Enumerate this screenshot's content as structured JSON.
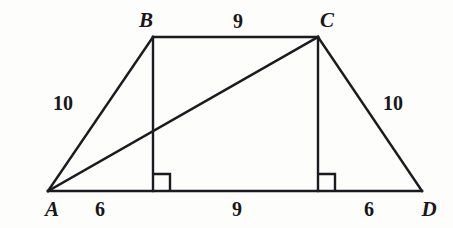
{
  "figure": {
    "stroke_color": "#1b1b1f",
    "background_color": "#fdfdfc",
    "stroke_width": 2.4,
    "vertices": [
      {
        "name": "A",
        "label": "A",
        "x": 48,
        "y": 191,
        "label_x": 52,
        "label_y": 209
      },
      {
        "name": "B",
        "label": "B",
        "x": 153,
        "y": 37,
        "label_x": 146,
        "label_y": 20
      },
      {
        "name": "C",
        "label": "C",
        "x": 318,
        "y": 37,
        "label_x": 327,
        "label_y": 20
      },
      {
        "name": "D",
        "label": "D",
        "x": 422,
        "y": 191,
        "label_x": 429,
        "label_y": 209
      }
    ],
    "segments": [
      {
        "name": "side-ab",
        "from": "A",
        "to": "B",
        "x1": 48,
        "y1": 191,
        "x2": 153,
        "y2": 37
      },
      {
        "name": "side-bc",
        "from": "B",
        "to": "C",
        "x1": 153,
        "y1": 37,
        "x2": 318,
        "y2": 37
      },
      {
        "name": "side-cd",
        "from": "C",
        "to": "D",
        "x1": 318,
        "y1": 37,
        "x2": 422,
        "y2": 191
      },
      {
        "name": "base-ad",
        "from": "A",
        "to": "D",
        "x1": 48,
        "y1": 191,
        "x2": 422,
        "y2": 191
      },
      {
        "name": "diagonal-ac",
        "from": "A",
        "to": "C",
        "x1": 48,
        "y1": 191,
        "x2": 318,
        "y2": 37
      },
      {
        "name": "altitude-from-b",
        "from": "B",
        "to": "foot-b",
        "x1": 153,
        "y1": 37,
        "x2": 153,
        "y2": 191
      },
      {
        "name": "altitude-from-c",
        "from": "C",
        "to": "foot-c",
        "x1": 318,
        "y1": 37,
        "x2": 318,
        "y2": 191
      }
    ],
    "right_angle_marks": [
      {
        "name": "right-angle-foot-b",
        "x": 153,
        "y": 191,
        "size": 17,
        "dir_x": 1
      },
      {
        "name": "right-angle-foot-c",
        "x": 318,
        "y": 191,
        "size": 17,
        "dir_x": 1
      }
    ],
    "measure_labels": [
      {
        "name": "length-ab",
        "text": "10",
        "x": 63,
        "y": 103,
        "for_segment": "side-ab"
      },
      {
        "name": "length-bc",
        "text": "9",
        "x": 238,
        "y": 21,
        "for_segment": "side-bc"
      },
      {
        "name": "length-cd",
        "text": "10",
        "x": 393,
        "y": 103,
        "for_segment": "side-cd"
      },
      {
        "name": "length-a-to-foot-b",
        "text": "6",
        "x": 100,
        "y": 209,
        "for_segment": "base-ad"
      },
      {
        "name": "length-foot-b-to-foot-c",
        "text": "9",
        "x": 237,
        "y": 209,
        "for_segment": "base-ad"
      },
      {
        "name": "length-foot-c-to-d",
        "text": "6",
        "x": 369,
        "y": 209,
        "for_segment": "base-ad"
      }
    ]
  },
  "chart_data": {
    "type": "diagram",
    "shape": "isosceles trapezoid",
    "labeled_lengths": {
      "AB": 10,
      "BC": 9,
      "CD": 10,
      "A_to_foot_of_B": 6,
      "foot_of_B_to_foot_of_C": 9,
      "foot_of_C_to_D": 6,
      "AD": 21
    },
    "right_angles_at": [
      "foot of altitude from B",
      "foot of altitude from C"
    ],
    "vertex_order": [
      "A",
      "B",
      "C",
      "D"
    ]
  }
}
